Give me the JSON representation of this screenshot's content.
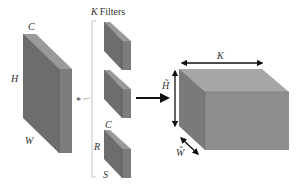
{
  "diagram": {
    "input": {
      "labels": {
        "channels": "C",
        "height": "H",
        "width": "W"
      }
    },
    "operator": "*",
    "filters": {
      "heading": "K Filters",
      "heading_var": "K",
      "heading_text": "Filters",
      "count_shown": 3,
      "labels": {
        "channels": "C",
        "rows": "R",
        "cols": "S"
      }
    },
    "arrow": "right-arrow",
    "output": {
      "labels": {
        "depth": "K",
        "height": "H̃",
        "width": "W̃"
      }
    },
    "colors": {
      "front_face": "#6d6d6d",
      "side_face": "#7c7c7c",
      "top_face": "#9a9a9a",
      "out_front": "#8e8e8e",
      "out_top": "#a6a6a6",
      "out_side": "#7a7a7a",
      "line": "#222222",
      "bracket": "#bdbdbd"
    }
  }
}
